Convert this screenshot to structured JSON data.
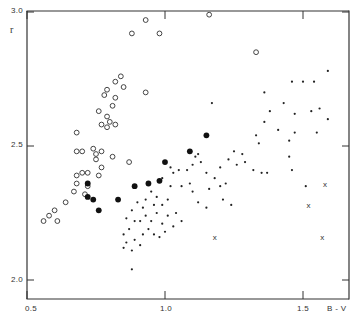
{
  "chart_data": {
    "type": "scatter",
    "title": "",
    "xlabel": "B - V",
    "ylabel": "r",
    "xlim": [
      0.5,
      1.67
    ],
    "ylim": [
      1.86,
      3.0
    ],
    "x_ticks": [
      {
        "value": 0.5,
        "label": "0.5"
      },
      {
        "value": 1.0,
        "label": "1.0"
      },
      {
        "value": 1.5,
        "label": "1.5"
      }
    ],
    "y_ticks": [
      {
        "value": 2.0,
        "label": "2.0"
      },
      {
        "value": 2.5,
        "label": "2.5"
      },
      {
        "value": 3.0,
        "label": "3.0"
      }
    ],
    "grid": false,
    "legend": null,
    "series": [
      {
        "name": "open circles",
        "marker": "open-circle",
        "points": [
          [
            0.93,
            2.97
          ],
          [
            0.88,
            2.92
          ],
          [
            0.98,
            2.92
          ],
          [
            1.16,
            2.99
          ],
          [
            1.33,
            2.85
          ],
          [
            0.84,
            2.76
          ],
          [
            0.82,
            2.74
          ],
          [
            0.85,
            2.72
          ],
          [
            0.82,
            2.68
          ],
          [
            0.79,
            2.71
          ],
          [
            0.78,
            2.69
          ],
          [
            0.81,
            2.65
          ],
          [
            0.93,
            2.7
          ],
          [
            0.76,
            2.63
          ],
          [
            0.79,
            2.61
          ],
          [
            0.8,
            2.59
          ],
          [
            0.77,
            2.58
          ],
          [
            0.79,
            2.57
          ],
          [
            0.82,
            2.58
          ],
          [
            0.68,
            2.55
          ],
          [
            0.68,
            2.48
          ],
          [
            0.7,
            2.48
          ],
          [
            0.74,
            2.49
          ],
          [
            0.75,
            2.47
          ],
          [
            0.77,
            2.48
          ],
          [
            0.75,
            2.45
          ],
          [
            0.81,
            2.46
          ],
          [
            0.77,
            2.42
          ],
          [
            0.72,
            2.4
          ],
          [
            0.87,
            2.44
          ],
          [
            0.76,
            2.39
          ],
          [
            0.68,
            2.39
          ],
          [
            0.7,
            2.4
          ],
          [
            0.68,
            2.36
          ],
          [
            0.72,
            2.35
          ],
          [
            0.67,
            2.33
          ],
          [
            0.71,
            2.32
          ],
          [
            0.64,
            2.29
          ],
          [
            0.6,
            2.26
          ],
          [
            0.58,
            2.24
          ],
          [
            0.56,
            2.22
          ],
          [
            0.61,
            2.22
          ]
        ]
      },
      {
        "name": "filled circles",
        "marker": "filled-circle",
        "points": [
          [
            0.72,
            2.36
          ],
          [
            0.72,
            2.31
          ],
          [
            0.74,
            2.3
          ],
          [
            0.76,
            2.26
          ],
          [
            0.83,
            2.3
          ],
          [
            0.89,
            2.35
          ],
          [
            0.94,
            2.36
          ],
          [
            0.98,
            2.37
          ],
          [
            1.0,
            2.44
          ],
          [
            1.09,
            2.48
          ],
          [
            1.15,
            2.54
          ]
        ]
      },
      {
        "name": "small dots",
        "marker": "dot",
        "points": [
          [
            1.17,
            2.66
          ],
          [
            1.36,
            2.7
          ],
          [
            1.46,
            2.74
          ],
          [
            1.5,
            2.74
          ],
          [
            1.54,
            2.74
          ],
          [
            1.59,
            2.78
          ],
          [
            1.38,
            2.63
          ],
          [
            1.43,
            2.66
          ],
          [
            1.47,
            2.62
          ],
          [
            1.53,
            2.63
          ],
          [
            1.56,
            2.64
          ],
          [
            1.36,
            2.59
          ],
          [
            1.41,
            2.56
          ],
          [
            1.47,
            2.55
          ],
          [
            1.55,
            2.55
          ],
          [
            1.59,
            2.6
          ],
          [
            1.33,
            2.54
          ],
          [
            1.45,
            2.52
          ],
          [
            1.34,
            2.51
          ],
          [
            1.25,
            2.48
          ],
          [
            1.28,
            2.47
          ],
          [
            1.29,
            2.44
          ],
          [
            1.2,
            2.42
          ],
          [
            1.23,
            2.45
          ],
          [
            1.26,
            2.43
          ],
          [
            1.32,
            2.41
          ],
          [
            1.35,
            2.4
          ],
          [
            1.37,
            2.4
          ],
          [
            1.18,
            2.38
          ],
          [
            1.15,
            2.4
          ],
          [
            1.13,
            2.44
          ],
          [
            1.11,
            2.46
          ],
          [
            1.1,
            2.43
          ],
          [
            1.12,
            2.47
          ],
          [
            1.05,
            2.41
          ],
          [
            1.08,
            2.41
          ],
          [
            1.02,
            2.42
          ],
          [
            1.03,
            2.4
          ],
          [
            0.99,
            2.38
          ],
          [
            1.02,
            2.35
          ],
          [
            1.06,
            2.35
          ],
          [
            1.09,
            2.36
          ],
          [
            1.1,
            2.33
          ],
          [
            1.12,
            2.29
          ],
          [
            1.15,
            2.27
          ],
          [
            1.16,
            2.34
          ],
          [
            1.2,
            2.35
          ],
          [
            1.22,
            2.36
          ],
          [
            1.24,
            2.28
          ],
          [
            1.21,
            2.3
          ],
          [
            1.45,
            2.46
          ],
          [
            1.46,
            2.41
          ],
          [
            1.51,
            2.35
          ],
          [
            0.95,
            2.33
          ],
          [
            0.97,
            2.31
          ],
          [
            0.93,
            2.3
          ],
          [
            0.96,
            2.28
          ],
          [
            0.99,
            2.28
          ],
          [
            1.01,
            2.3
          ],
          [
            0.92,
            2.27
          ],
          [
            0.9,
            2.29
          ],
          [
            0.88,
            2.26
          ],
          [
            0.86,
            2.23
          ],
          [
            0.89,
            2.22
          ],
          [
            0.91,
            2.22
          ],
          [
            0.93,
            2.24
          ],
          [
            0.95,
            2.22
          ],
          [
            0.97,
            2.25
          ],
          [
            0.99,
            2.21
          ],
          [
            1.01,
            2.24
          ],
          [
            1.04,
            2.25
          ],
          [
            1.06,
            2.22
          ],
          [
            0.94,
            2.19
          ],
          [
            0.96,
            2.17
          ],
          [
            0.98,
            2.16
          ],
          [
            1.0,
            2.18
          ],
          [
            1.03,
            2.2
          ],
          [
            0.87,
            2.19
          ],
          [
            0.85,
            2.17
          ],
          [
            0.89,
            2.15
          ],
          [
            0.92,
            2.17
          ],
          [
            0.86,
            2.14
          ],
          [
            0.88,
            2.11
          ],
          [
            0.91,
            2.13
          ],
          [
            0.85,
            2.12
          ],
          [
            0.88,
            2.04
          ]
        ]
      },
      {
        "name": "crosses",
        "marker": "x",
        "points": [
          [
            1.58,
            2.36
          ],
          [
            1.52,
            2.28
          ],
          [
            1.18,
            2.16
          ],
          [
            1.57,
            2.16
          ]
        ]
      }
    ]
  },
  "labels": {
    "ylabel": "r",
    "xlabel": "B - V",
    "y_3_0": "3.0",
    "y_2_5": "2.5",
    "y_2_0": "2.0",
    "x_0_5": "0.5",
    "x_1_0": "1.0",
    "x_1_5": "1.5"
  }
}
